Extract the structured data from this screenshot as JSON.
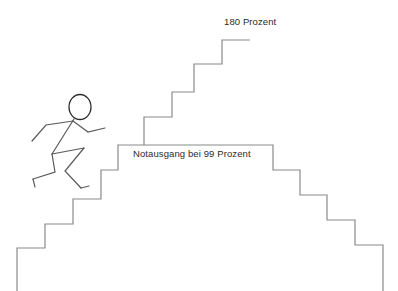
{
  "illustration": {
    "title": "Treppe mit Strichmaennchen",
    "background_color": "#ffffff",
    "line_color": "#8a8a8a",
    "figure_line_color": "#5a5a5a",
    "text_color": "#2b2b2b"
  },
  "labels": {
    "top": "180 Prozent",
    "middle": "Notausgang bei 99 Prozent"
  },
  "figure": {
    "name": "running-stick-figure",
    "head_color": "#2b2b2b"
  },
  "chart_data": {
    "type": "line",
    "xlabel": "",
    "ylabel": "Prozent",
    "annotations": [
      {
        "text": "180 Prozent",
        "x": 236,
        "y": 22
      },
      {
        "text": "Notausgang bei 99 Prozent",
        "x": 196,
        "y": 155
      }
    ],
    "series": [
      {
        "name": "staircase-outline",
        "points": [
          [
            17,
            291
          ],
          [
            17,
            248
          ],
          [
            45,
            248
          ],
          [
            45,
            224
          ],
          [
            73,
            224
          ],
          [
            73,
            199
          ],
          [
            101,
            199
          ],
          [
            101,
            170
          ],
          [
            118,
            170
          ],
          [
            118,
            145
          ],
          [
            273,
            145
          ],
          [
            273,
            170
          ],
          [
            300,
            170
          ],
          [
            300,
            195
          ],
          [
            327,
            195
          ],
          [
            327,
            220
          ],
          [
            355,
            220
          ],
          [
            355,
            245
          ],
          [
            383,
            245
          ],
          [
            383,
            291
          ]
        ]
      },
      {
        "name": "upper-staircase",
        "points": [
          [
            144,
            145
          ],
          [
            144,
            117
          ],
          [
            172,
            117
          ],
          [
            172,
            92
          ],
          [
            194,
            92
          ],
          [
            194,
            64
          ],
          [
            222,
            64
          ],
          [
            222,
            40
          ],
          [
            250,
            40
          ]
        ]
      }
    ],
    "grid": false,
    "legend": null
  }
}
